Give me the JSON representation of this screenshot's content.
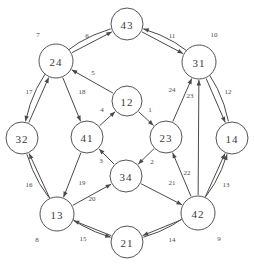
{
  "diagram": {
    "type": "directed-graph",
    "canvas": {
      "width": 254,
      "height": 265
    },
    "style": {
      "node_fill": "#ffffff",
      "node_stroke": "#555555",
      "edge_stroke": "#4a4a4a",
      "label_color": "#3a3a3a",
      "background": "#ffffff"
    },
    "nodes": [
      {
        "id": "43",
        "label": "43",
        "x": 127,
        "y": 24,
        "r": 16
      },
      {
        "id": "24",
        "label": "24",
        "x": 56,
        "y": 61,
        "r": 17
      },
      {
        "id": "31",
        "label": "31",
        "x": 199,
        "y": 62,
        "r": 17
      },
      {
        "id": "32",
        "label": "32",
        "x": 22,
        "y": 138,
        "r": 16
      },
      {
        "id": "14",
        "label": "14",
        "x": 232,
        "y": 138,
        "r": 16
      },
      {
        "id": "12",
        "label": "12",
        "x": 127,
        "y": 101,
        "r": 15
      },
      {
        "id": "41",
        "label": "41",
        "x": 87,
        "y": 137,
        "r": 16
      },
      {
        "id": "23",
        "label": "23",
        "x": 166,
        "y": 137,
        "r": 16
      },
      {
        "id": "34",
        "label": "34",
        "x": 126,
        "y": 176,
        "r": 16
      },
      {
        "id": "13",
        "label": "13",
        "x": 57,
        "y": 214,
        "r": 17
      },
      {
        "id": "42",
        "label": "42",
        "x": 198,
        "y": 213,
        "r": 17
      },
      {
        "id": "21",
        "label": "21",
        "x": 127,
        "y": 242,
        "r": 16
      }
    ],
    "edges": [
      {
        "label": "1",
        "from": "12",
        "to": "23",
        "lx": 150,
        "ly": 110
      },
      {
        "label": "2",
        "from": "23",
        "to": "34",
        "lx": 152,
        "ly": 162
      },
      {
        "label": "3",
        "from": "34",
        "to": "41",
        "lx": 101,
        "ly": 161
      },
      {
        "label": "4",
        "from": "41",
        "to": "12",
        "lx": 102,
        "ly": 110
      },
      {
        "label": "5",
        "from": "12",
        "to": "24",
        "lx": 93,
        "ly": 73
      },
      {
        "label": "6",
        "from": "24",
        "to": "43",
        "lx": 87,
        "ly": 36
      },
      {
        "label": "7",
        "from": "43",
        "to": "32",
        "lx": 38,
        "ly": 35
      },
      {
        "label": "8",
        "from": "32",
        "to": "21",
        "lx": 37,
        "ly": 240
      },
      {
        "label": "9",
        "from": "21",
        "to": "14",
        "lx": 219,
        "ly": 239
      },
      {
        "label": "10",
        "from": "14",
        "to": "43",
        "lx": 214,
        "ly": 35
      },
      {
        "label": "11",
        "from": "43",
        "to": "31",
        "lx": 172,
        "ly": 36
      },
      {
        "label": "12",
        "from": "31",
        "to": "14",
        "lx": 228,
        "ly": 92
      },
      {
        "label": "13",
        "from": "42",
        "to": "14",
        "lx": 226,
        "ly": 185
      },
      {
        "label": "14",
        "from": "42",
        "to": "21",
        "lx": 172,
        "ly": 240
      },
      {
        "label": "15",
        "from": "21",
        "to": "13",
        "lx": 83,
        "ly": 239
      },
      {
        "label": "16",
        "from": "13",
        "to": "32",
        "lx": 29,
        "ly": 185
      },
      {
        "label": "17",
        "from": "32",
        "to": "24",
        "lx": 29,
        "ly": 92
      },
      {
        "label": "18",
        "from": "24",
        "to": "41",
        "lx": 82,
        "ly": 92
      },
      {
        "label": "19",
        "from": "41",
        "to": "13",
        "lx": 82,
        "ly": 183
      },
      {
        "label": "20",
        "from": "13",
        "to": "34",
        "lx": 92,
        "ly": 199
      },
      {
        "label": "21",
        "from": "34",
        "to": "42",
        "lx": 172,
        "ly": 183
      },
      {
        "label": "22",
        "from": "42",
        "to": "23",
        "lx": 187,
        "ly": 173
      },
      {
        "label": "23",
        "from": "42",
        "to": "31",
        "lx": 190,
        "ly": 96
      },
      {
        "label": "24",
        "from": "23",
        "to": "31",
        "lx": 172,
        "ly": 90
      }
    ]
  }
}
